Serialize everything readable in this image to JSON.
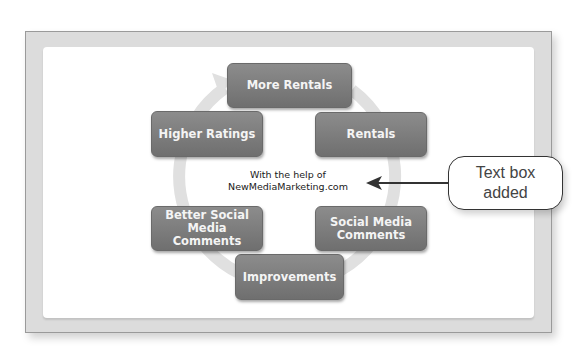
{
  "diagram": {
    "type": "cycle",
    "nodes": [
      {
        "id": "more-rentals",
        "label": "More Rentals"
      },
      {
        "id": "rentals",
        "label": "Rentals"
      },
      {
        "id": "social-media-comments",
        "label": "Social Media Comments"
      },
      {
        "id": "improvements",
        "label": "Improvements"
      },
      {
        "id": "better-social-media-comments",
        "label": "Better Social Media Comments"
      },
      {
        "id": "higher-ratings",
        "label": "Higher Ratings"
      }
    ],
    "center_text": {
      "line1": "With the help of",
      "line2": "NewMediaMarketing.com"
    }
  },
  "callout": {
    "line1": "Text box",
    "line2": "added"
  },
  "colors": {
    "node_fill": "#7d7d7d",
    "ring": "#e2e2e2",
    "frame": "#dcdcdc"
  }
}
